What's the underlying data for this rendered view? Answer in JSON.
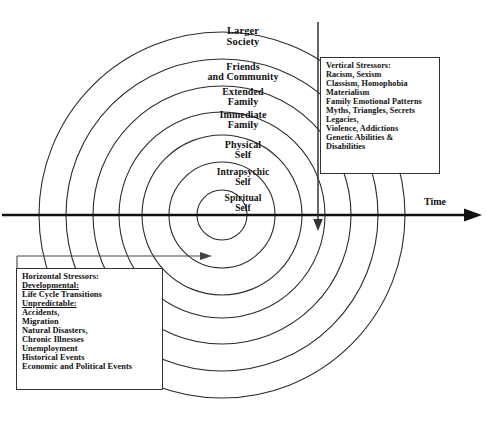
{
  "diagram": {
    "title_rings": [
      {
        "label_line1": "Larger",
        "label_line2": "Society",
        "top": 26,
        "font": 10.5
      },
      {
        "label_line1": "Friends",
        "label_line2": "and Community",
        "top": 62,
        "font": 10
      },
      {
        "label_line1": "Extended",
        "label_line2": "Family",
        "top": 87,
        "font": 10
      },
      {
        "label_line1": "Immediate",
        "label_line2": "Family",
        "top": 110,
        "font": 10
      },
      {
        "label_line1": "Physical",
        "label_line2": "Self",
        "top": 140,
        "font": 10
      },
      {
        "label_line1": "Intrapsychic",
        "label_line2": "Self",
        "top": 168,
        "font": 9.5
      },
      {
        "label_line1": "Spiritual",
        "label_line2": "Self",
        "top": 194,
        "font": 9.5
      }
    ],
    "vertical_stressors": {
      "heading": "Vertical Stressors:",
      "lines": [
        "Racism, Sexism",
        "Classism, Homophobia",
        "Materialism",
        "Family Emotional Patterns",
        "Myths, Triangles, Secrets",
        "Legacies,",
        "Violence, Addictions",
        "Genetic Abilities &",
        "Disabilities"
      ]
    },
    "horizontal_stressors": {
      "heading": "Horizontal Stressors:",
      "sub1": "Developmental:",
      "sub1_items": [
        "Life Cycle Transitions"
      ],
      "sub2": "Unpredictable:",
      "sub2_items": [
        "Accidents,",
        "Migration",
        "Natural Disasters,",
        "Chronic Illnesses",
        "Unemployment",
        "Historical Events",
        "Economic and Political  Events"
      ]
    },
    "time_axis_label": "Time",
    "colors": {
      "ink": "#1a1a1a",
      "ring_stroke": "#2b2b2b",
      "axis": "#111111",
      "box_border": "#333333",
      "background": "#ffffff"
    },
    "geometry": {
      "center_x": 222,
      "center_y": 215,
      "ring_radii": [
        25,
        53,
        80,
        103,
        129,
        156,
        183
      ],
      "axis_y": 215,
      "vertical_arrow_x": 318,
      "vertical_arrow_top": 22,
      "vertical_arrow_bottom": 228
    }
  }
}
